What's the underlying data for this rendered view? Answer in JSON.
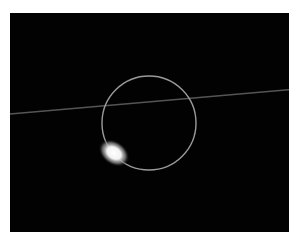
{
  "image": {
    "description": "Dark astronomical image showing a thin circular ring with a bright glowing blob at its lower-left edge and a faint diagonal streak crossing the frame",
    "background_color": "#020202",
    "ring_color": "#9a9a9a",
    "blob_color": "#ffffff",
    "streak_color": "#6a6a6a"
  }
}
